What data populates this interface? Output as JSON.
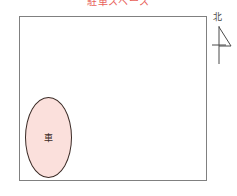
{
  "diagram": {
    "title": "駐車スペース",
    "title_color": "#e8615a",
    "background_color": "#ffffff"
  },
  "plot_area": {
    "name": "site-boundary-rectangle",
    "border_color": "#808080",
    "fill_color": "#ffffff"
  },
  "features": [
    {
      "id": "car-parking-ellipse",
      "shape": "ellipse",
      "label": "車",
      "fill_color": "#fbe0dc",
      "stroke_color": "#3b2b26"
    }
  ],
  "compass": {
    "label": "北",
    "label_color": "#4a4a4a",
    "arrow_color": "#4a4a4a",
    "direction": "north-up"
  }
}
